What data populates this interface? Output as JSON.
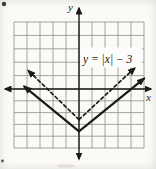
{
  "chart_data": {
    "type": "line",
    "title": "",
    "equation_label": "y = |x| − 3",
    "xlabel": "x",
    "ylabel": "y",
    "x_range": [
      -5,
      5
    ],
    "y_range": [
      -5,
      5
    ],
    "grid": true,
    "grid_squares": [
      10,
      10
    ],
    "legend": "none",
    "series": [
      {
        "name": "absolute-value-solid",
        "style": "solid",
        "label": "y = |x| − 3",
        "vertex": [
          0,
          -3
        ],
        "slope": 1,
        "arrows_on_ends": true,
        "points": [
          [
            -4.2,
            0.7
          ],
          [
            0,
            -3
          ],
          [
            5.0,
            1.3
          ]
        ]
      },
      {
        "name": "absolute-value-dashed",
        "style": "dashed",
        "label": "",
        "vertex": [
          0,
          -2
        ],
        "slope": 1,
        "arrows_on_ends": true,
        "points": [
          [
            -3.9,
            1.9
          ],
          [
            0,
            -2
          ],
          [
            4.3,
            2.1
          ]
        ]
      }
    ],
    "colors": {
      "curve": "#1a1a1a",
      "axis": "#1a1a1a",
      "grid": "#8d8d8d",
      "background": "#fbfaf7",
      "label_patch": "#fcfcfa"
    }
  }
}
